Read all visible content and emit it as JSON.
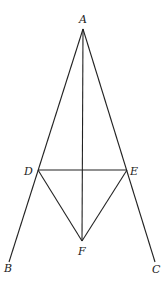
{
  "diagram": {
    "type": "geometry",
    "points": {
      "A": {
        "label": "A",
        "x": 83,
        "y": 29
      },
      "B": {
        "label": "B",
        "x": 9,
        "y": 262
      },
      "C": {
        "label": "C",
        "x": 155,
        "y": 262
      },
      "D": {
        "label": "D",
        "x": 38,
        "y": 170
      },
      "E": {
        "label": "E",
        "x": 127,
        "y": 170
      },
      "F": {
        "label": "F",
        "x": 82,
        "y": 241
      }
    },
    "segments": [
      "AB",
      "AC",
      "AF",
      "DE",
      "DF",
      "EF"
    ],
    "colors": {
      "stroke": "#222222",
      "background": "#ffffff"
    }
  }
}
